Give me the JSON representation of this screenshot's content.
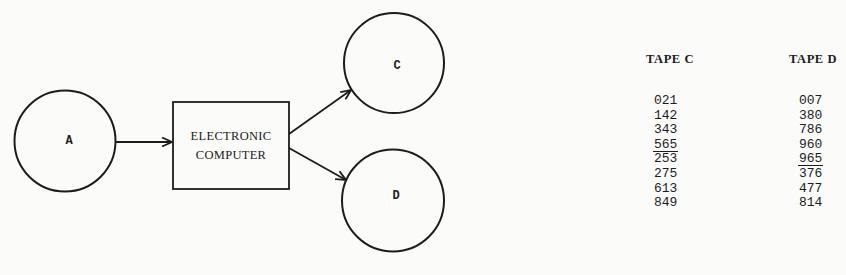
{
  "diagram": {
    "nodes": {
      "source": {
        "label": "A",
        "shape": "circle"
      },
      "computer": {
        "line1": "ELECTRONIC",
        "line2": "COMPUTER",
        "shape": "rectangle"
      },
      "output_c": {
        "label": "C",
        "shape": "circle"
      },
      "output_d": {
        "label": "D",
        "shape": "circle"
      }
    },
    "edges": [
      {
        "from": "A",
        "to": "ELECTRONIC COMPUTER"
      },
      {
        "from": "ELECTRONIC COMPUTER",
        "to": "C"
      },
      {
        "from": "ELECTRONIC COMPUTER",
        "to": "D"
      }
    ],
    "colors": {
      "ink": "#1c1c1c",
      "paper": "#fbfbfa"
    }
  },
  "tapes": {
    "tape_c": {
      "title": "TAPE C",
      "values": [
        "021",
        "142",
        "343",
        "565",
        "253",
        "275",
        "613",
        "849"
      ],
      "underlined_index": 3
    },
    "tape_d": {
      "title": "TAPE D",
      "values": [
        "007",
        "380",
        "786",
        "960",
        "965",
        "376",
        "477",
        "814"
      ],
      "underlined_index": 4
    }
  }
}
